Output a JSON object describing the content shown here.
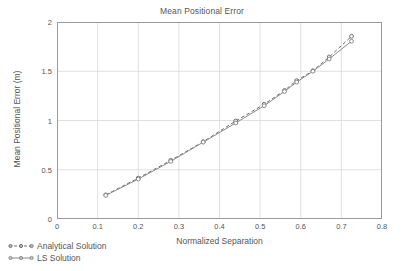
{
  "chart_data": {
    "type": "line",
    "title": "Mean Positional Error",
    "xlabel": "Normalized Separation",
    "ylabel": "Mean Positional Error (m)",
    "xlim": [
      0,
      0.8
    ],
    "ylim": [
      0,
      2
    ],
    "xticks": [
      "0",
      "0.1",
      "0.2",
      "0.3",
      "0.4",
      "0.5",
      "0.6",
      "0.7",
      "0.8"
    ],
    "xtick_values": [
      0,
      0.1,
      0.2,
      0.3,
      0.4,
      0.5,
      0.6,
      0.7,
      0.8
    ],
    "yticks": [
      "0",
      "0.5",
      "1",
      "1.5",
      "2"
    ],
    "ytick_values": [
      0,
      0.5,
      1,
      1.5,
      2
    ],
    "grid": true,
    "legend_position": "below-left",
    "x": [
      0.12,
      0.2,
      0.28,
      0.36,
      0.44,
      0.51,
      0.56,
      0.59,
      0.63,
      0.67,
      0.725
    ],
    "series": [
      {
        "name": "Analytical Solution",
        "marker": "circle-open",
        "linestyle": "dashed",
        "color": "#6e6e6e",
        "values": [
          0.245,
          0.415,
          0.595,
          0.785,
          0.995,
          1.165,
          1.305,
          1.405,
          1.505,
          1.645,
          1.855
        ]
      },
      {
        "name": "LS Solution",
        "marker": "circle-open",
        "linestyle": "solid",
        "color": "#8a8a8a",
        "values": [
          0.24,
          0.405,
          0.585,
          0.78,
          0.975,
          1.15,
          1.295,
          1.39,
          1.5,
          1.625,
          1.805
        ]
      }
    ]
  },
  "legend": {
    "items": [
      {
        "label": "Analytical Solution"
      },
      {
        "label": "LS Solution"
      }
    ]
  },
  "colors": {
    "axis": "#9a9a9a",
    "grid": "#d8d8d8",
    "text": "#555555",
    "series_a": "#6e6e6e",
    "series_b": "#8a8a8a"
  }
}
